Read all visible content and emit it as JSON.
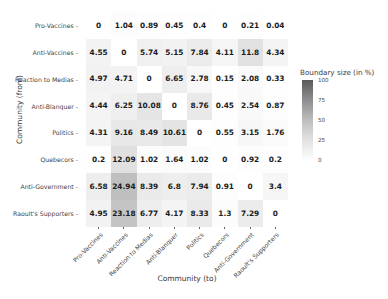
{
  "chart_data": {
    "type": "heatmap",
    "title": "",
    "xlabel": "Community (to)",
    "ylabel": "Community (from)",
    "categories_x": [
      "Pro-Vaccines",
      "Anti-Vaccines",
      "Reaction to Medias",
      "Anti-Blanquer",
      "Politics",
      "Quebecors",
      "Anti-Government",
      "Raoult's Supporters"
    ],
    "categories_y": [
      "Pro-Vaccines",
      "Anti-Vaccines",
      "Reaction to Medias",
      "Anti-Blanquer",
      "Politics",
      "Quebecors",
      "Anti-Government",
      "Raoult's Supporters"
    ],
    "values": [
      [
        0,
        1.04,
        0.89,
        0.45,
        0.4,
        0,
        0.21,
        0.04
      ],
      [
        4.55,
        0,
        5.74,
        5.15,
        7.84,
        4.11,
        11.8,
        4.34
      ],
      [
        4.97,
        4.71,
        0,
        6.65,
        2.78,
        0.15,
        2.08,
        0.33
      ],
      [
        4.44,
        6.25,
        10.08,
        0,
        8.76,
        0.45,
        2.54,
        0.87
      ],
      [
        4.31,
        9.16,
        8.49,
        10.61,
        0,
        0.55,
        3.15,
        1.76
      ],
      [
        0.2,
        12.09,
        1.02,
        1.64,
        1.02,
        0,
        0.92,
        0.2
      ],
      [
        6.58,
        24.94,
        8.39,
        6.8,
        7.94,
        0.91,
        0,
        3.4
      ],
      [
        4.95,
        23.18,
        6.77,
        4.17,
        8.33,
        1.3,
        7.29,
        0
      ]
    ],
    "value_labels": [
      [
        "0",
        "1.04",
        "0.89",
        "0.45",
        "0.4",
        "0",
        "0.21",
        "0.04"
      ],
      [
        "4.55",
        "0",
        "5.74",
        "5.15",
        "7.84",
        "4.11",
        "11.8",
        "4.34"
      ],
      [
        "4.97",
        "4.71",
        "0",
        "6.65",
        "2.78",
        "0.15",
        "2.08",
        "0.33"
      ],
      [
        "4.44",
        "6.25",
        "10.08",
        "0",
        "8.76",
        "0.45",
        "2.54",
        "0.87"
      ],
      [
        "4.31",
        "9.16",
        "8.49",
        "10.61",
        "0",
        "0.55",
        "3.15",
        "1.76"
      ],
      [
        "0.2",
        "12.09",
        "1.02",
        "1.64",
        "1.02",
        "0",
        "0.92",
        "0.2"
      ],
      [
        "6.58",
        "24.94",
        "8.39",
        "6.8",
        "7.94",
        "0.91",
        "0",
        "3.4"
      ],
      [
        "4.95",
        "23.18",
        "6.77",
        "4.17",
        "8.33",
        "1.3",
        "7.29",
        "0"
      ]
    ],
    "colorbar": {
      "title": "Boundary size (in %)",
      "ticks": [
        "100",
        "75",
        "50",
        "25",
        "0"
      ],
      "vmin": 0,
      "vmax": 100,
      "colormap": "greys",
      "low_color": "#ffffff",
      "high_color": "#000000"
    },
    "grid": false,
    "legend_position": "right"
  }
}
